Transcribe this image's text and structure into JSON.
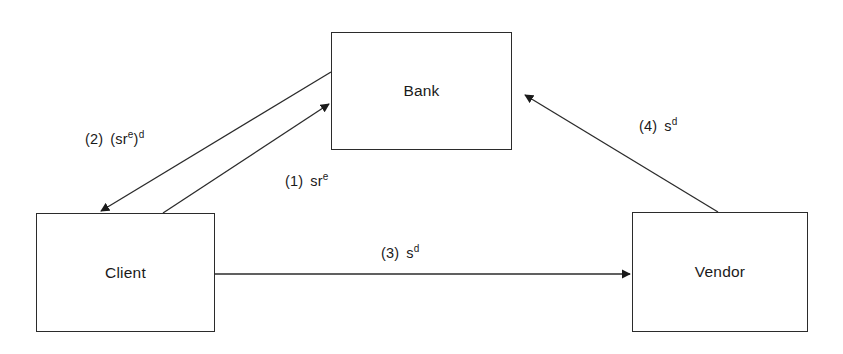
{
  "diagram": {
    "type": "protocol-flow-diagram",
    "background_color": "#ffffff",
    "line_color": "#2b2b2b",
    "text_color": "#1a1a1a",
    "nodes": [
      {
        "id": "bank",
        "label": "Bank",
        "x": 331,
        "y": 32,
        "width": 181,
        "height": 118
      },
      {
        "id": "client",
        "label": "Client",
        "x": 36,
        "y": 213,
        "width": 179,
        "height": 119
      },
      {
        "id": "vendor",
        "label": "Vendor",
        "x": 632,
        "y": 212,
        "width": 176,
        "height": 120
      }
    ],
    "edges": [
      {
        "id": "edge-1",
        "step": "(1)",
        "expression_base": "sr",
        "expression_sup": "e",
        "label_plain": "(1)  sr^e",
        "from": "client",
        "to": "bank",
        "arrowhead": "bank",
        "x1": 163,
        "y1": 213,
        "x2": 331,
        "y2": 103
      },
      {
        "id": "edge-2",
        "step": "(2)",
        "expression_base": "(sr",
        "expression_sup": "e",
        "expression_mid": ")",
        "expression_sup2": "d",
        "label_plain": "(2)  (sr^e)^d",
        "from": "bank",
        "to": "client",
        "arrowhead": "client",
        "x1": 331,
        "y1": 72,
        "x2": 100,
        "y2": 212
      },
      {
        "id": "edge-3",
        "step": "(3)",
        "expression_base": "s",
        "expression_sup": "d",
        "label_plain": "(3)  s^d",
        "from": "client",
        "to": "vendor",
        "arrowhead": "vendor",
        "x1": 215,
        "y1": 274,
        "x2": 632,
        "y2": 274
      },
      {
        "id": "edge-4",
        "step": "(4)",
        "expression_base": "s",
        "expression_sup": "d",
        "label_plain": "(4)  s^d",
        "from": "vendor",
        "to": "bank",
        "arrowhead": "bank",
        "x1": 718,
        "y1": 212,
        "x2": 524,
        "y2": 94
      }
    ]
  }
}
